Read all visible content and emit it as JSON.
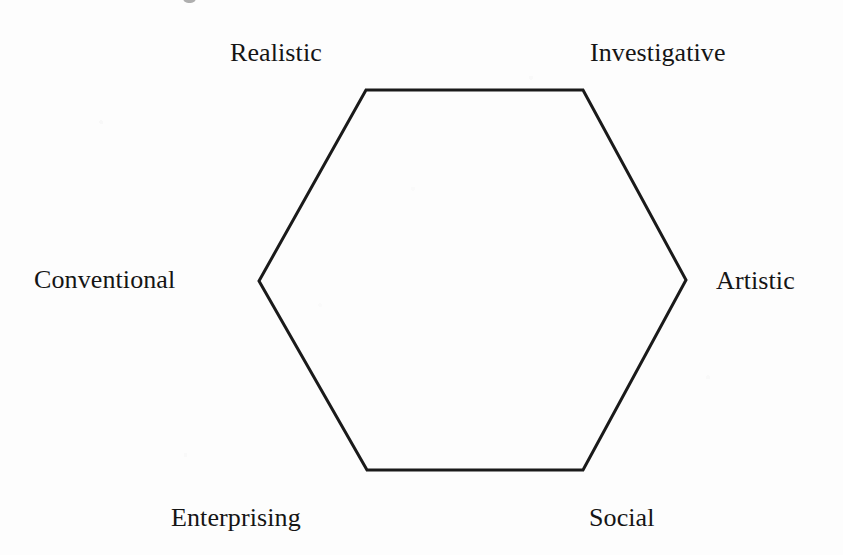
{
  "figure": {
    "name": "Holland RIASEC hexagon",
    "background_color": "#fdfdfd",
    "stroke_color": "#1a1a1a",
    "stroke_width": 3
  },
  "chart_data": {
    "type": "diagram",
    "shape": "hexagon",
    "title": "",
    "subtitle": "",
    "xlabel": "",
    "ylabel": "",
    "grid": false,
    "legend": "none",
    "orientation": "flat-top-and-bottom, pointed-left-and-right",
    "canvas": {
      "width": 843,
      "height": 555
    },
    "categories": [
      "Realistic",
      "Investigative",
      "Artistic",
      "Social",
      "Enterprising",
      "Conventional"
    ],
    "vertices": [
      {
        "label": "Realistic",
        "corner": "top-left",
        "x": 366,
        "y": 90
      },
      {
        "label": "Investigative",
        "corner": "top-right",
        "x": 583,
        "y": 90
      },
      {
        "label": "Artistic",
        "corner": "right",
        "x": 686,
        "y": 280
      },
      {
        "label": "Social",
        "corner": "bottom-right",
        "x": 583,
        "y": 470
      },
      {
        "label": "Enterprising",
        "corner": "bottom-left",
        "x": 367,
        "y": 470
      },
      {
        "label": "Conventional",
        "corner": "left",
        "x": 259,
        "y": 281
      }
    ],
    "edges": [
      {
        "from": "Realistic",
        "to": "Investigative"
      },
      {
        "from": "Investigative",
        "to": "Artistic"
      },
      {
        "from": "Artistic",
        "to": "Social"
      },
      {
        "from": "Social",
        "to": "Enterprising"
      },
      {
        "from": "Enterprising",
        "to": "Conventional"
      },
      {
        "from": "Conventional",
        "to": "Realistic"
      }
    ]
  },
  "labels": {
    "realistic": "Realistic",
    "investigative": "Investigative",
    "artistic": "Artistic",
    "social": "Social",
    "enterprising": "Enterprising",
    "conventional": "Conventional"
  }
}
